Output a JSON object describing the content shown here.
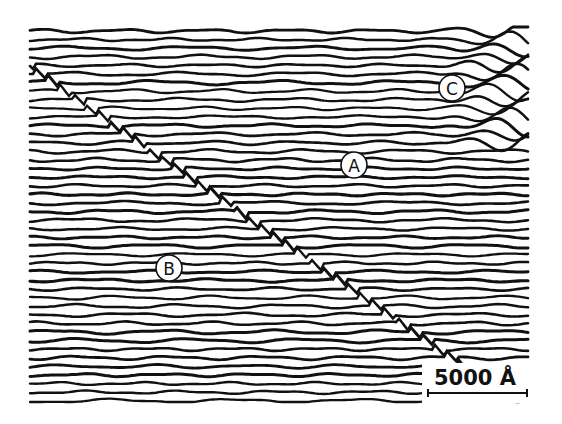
{
  "figure": {
    "frame": {
      "x": 30,
      "y": 27,
      "width": 500,
      "height": 375
    },
    "colors": {
      "background": "#ffffff",
      "ink": "#111111"
    },
    "line_spacing": 8.6,
    "line_count": 44,
    "labels": [
      {
        "id": "A",
        "text": "A",
        "cx": 354,
        "cy": 165,
        "r": 13
      },
      {
        "id": "B",
        "text": "B",
        "cx": 169,
        "cy": 268,
        "r": 13
      },
      {
        "id": "C",
        "text": "C",
        "cx": 452,
        "cy": 88,
        "r": 13
      }
    ],
    "scale_bar": {
      "text": "5000 Å",
      "text_x": 434,
      "text_y": 385,
      "bar_x1": 428,
      "bar_x2": 527,
      "bar_y": 393
    }
  }
}
